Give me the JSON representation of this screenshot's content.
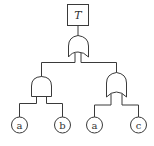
{
  "diagram": {
    "type": "fault-tree",
    "top_event": {
      "label": "T"
    },
    "top_gate": {
      "type": "OR"
    },
    "left_gate": {
      "type": "AND",
      "inputs": [
        "a",
        "b"
      ]
    },
    "right_gate": {
      "type": "OR",
      "inputs": [
        "a",
        "c"
      ]
    },
    "basic_events": [
      {
        "label": "a"
      },
      {
        "label": "b"
      },
      {
        "label": "a"
      },
      {
        "label": "c"
      }
    ],
    "colors": {
      "line": "#3a3a3a",
      "background": "#ffffff"
    }
  }
}
